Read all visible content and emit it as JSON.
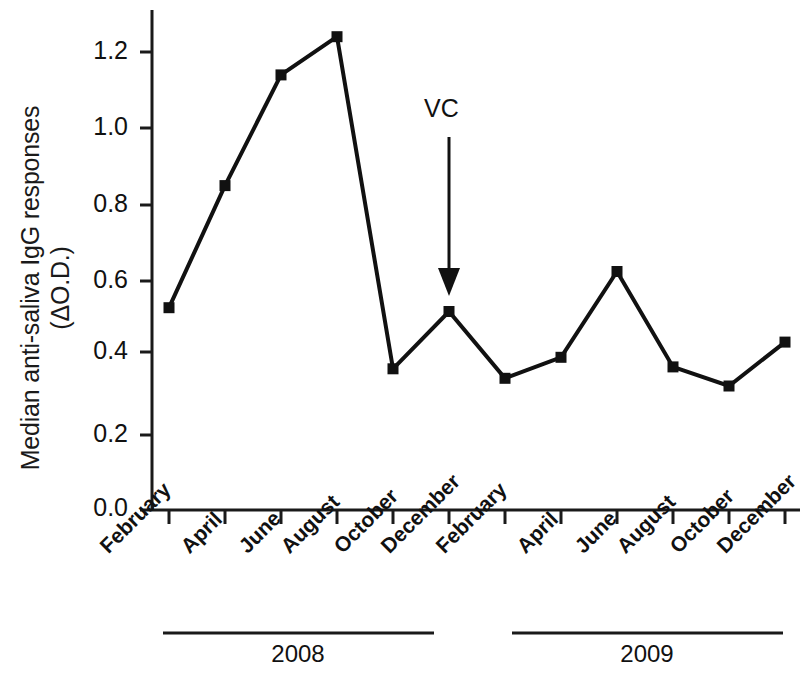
{
  "chart_data": {
    "type": "line",
    "title": "",
    "xlabel": "",
    "ylabel": "Median anti-saliva IgG responses (ΔO.D.)",
    "ylabel_line1": "Median anti-saliva IgG responses",
    "ylabel_line2": "(ΔO.D.)",
    "ylim": [
      0.0,
      1.3
    ],
    "yticks": [
      0.0,
      0.2,
      0.4,
      0.6,
      0.8,
      1.0,
      1.2
    ],
    "ytick_labels": [
      "0.0",
      "0.2",
      "0.4",
      "0.6",
      "0.8",
      "1.0",
      "1.2"
    ],
    "grid": false,
    "legend": false,
    "categories": [
      "February",
      "April",
      "June",
      "August",
      "October",
      "December",
      "February",
      "April",
      "June",
      "August",
      "October",
      "December"
    ],
    "values": [
      0.53,
      0.85,
      1.14,
      1.24,
      0.37,
      0.52,
      0.345,
      0.4,
      0.625,
      0.375,
      0.325,
      0.44
    ],
    "series": [
      {
        "name": "Median anti-saliva IgG",
        "marker": "square",
        "color": "#111111",
        "values": [
          0.53,
          0.85,
          1.14,
          1.24,
          0.37,
          0.52,
          0.345,
          0.4,
          0.625,
          0.375,
          0.325,
          0.44
        ]
      }
    ],
    "group_labels": [
      "2008",
      "2009"
    ],
    "groups": [
      {
        "label": "2008",
        "start_index": 0,
        "end_index": 5
      },
      {
        "label": "2009",
        "start_index": 6,
        "end_index": 11
      }
    ],
    "annotations": [
      {
        "text": "VC",
        "type": "arrow-down",
        "target_category_index": 5,
        "target_value": 0.52,
        "description": "Downward arrow marking vaccination/control time point at December 2008"
      }
    ]
  }
}
